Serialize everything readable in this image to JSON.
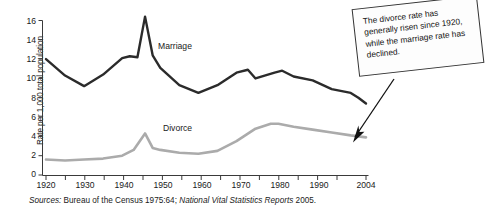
{
  "chart_data": {
    "type": "line",
    "title": "",
    "xlabel": "",
    "ylabel": "Rate per 1,000 total population",
    "xlim": [
      1920,
      2004
    ],
    "ylim": [
      0,
      16
    ],
    "grid": false,
    "legend_position": "inline-labels",
    "x_tick_labels": [
      "1920",
      "1930",
      "1940",
      "1950",
      "1960",
      "1970",
      "1980",
      "1990",
      "2004"
    ],
    "x_tick_values": [
      1920,
      1930,
      1940,
      1950,
      1960,
      1970,
      1980,
      1990,
      2004
    ],
    "x_minor_ticks": [
      1925,
      1935,
      1945,
      1955,
      1965,
      1975,
      1985,
      1995,
      2000
    ],
    "y_tick_labels": [
      "16",
      "14",
      "12",
      "10",
      "8",
      "6",
      "4",
      "2",
      "0"
    ],
    "y_tick_values": [
      16,
      14,
      12,
      10,
      8,
      6,
      4,
      2,
      0
    ],
    "series": [
      {
        "name": "Marriage",
        "color": "#2b2b2b",
        "x": [
          1920,
          1925,
          1930,
          1935,
          1940,
          1942,
          1944,
          1946,
          1948,
          1950,
          1955,
          1960,
          1965,
          1970,
          1973,
          1975,
          1980,
          1982,
          1985,
          1990,
          1995,
          2000,
          2002,
          2004
        ],
        "values": [
          12.0,
          10.3,
          9.2,
          10.4,
          12.1,
          12.3,
          12.2,
          16.4,
          12.4,
          11.1,
          9.3,
          8.5,
          9.3,
          10.6,
          10.9,
          10.0,
          10.6,
          10.8,
          10.2,
          9.8,
          8.9,
          8.5,
          8.0,
          7.4
        ]
      },
      {
        "name": "Divorce",
        "color": "#ababab",
        "x": [
          1920,
          1925,
          1930,
          1935,
          1940,
          1943,
          1946,
          1948,
          1950,
          1955,
          1960,
          1965,
          1970,
          1975,
          1979,
          1981,
          1985,
          1990,
          1995,
          2000,
          2004
        ],
        "values": [
          1.6,
          1.5,
          1.6,
          1.7,
          2.0,
          2.6,
          4.3,
          2.8,
          2.6,
          2.3,
          2.2,
          2.5,
          3.5,
          4.8,
          5.3,
          5.3,
          5.0,
          4.7,
          4.4,
          4.1,
          3.9
        ]
      }
    ],
    "annotations": [
      {
        "name": "callout",
        "text": "The divorce rate has generally risen since 1920, while the marriage rate has declined.",
        "points_to": "divorce-series-end"
      }
    ],
    "source": {
      "label": "Sources:",
      "part1": " Bureau of the Census 1975:64; ",
      "italic": "National Vital Statistics Reports",
      "part2": " 2005."
    }
  }
}
